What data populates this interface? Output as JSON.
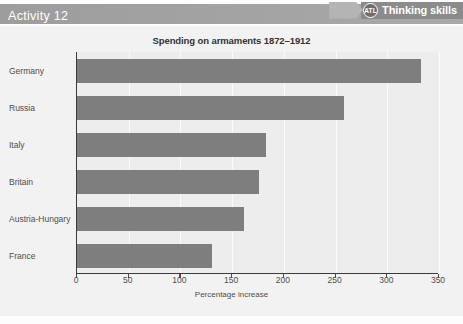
{
  "header": {
    "activity_title": "Activity 12",
    "badge": {
      "circle_text": "ATL",
      "label": "Thinking skills"
    }
  },
  "chart_data": {
    "type": "bar",
    "orientation": "horizontal",
    "title": "Spending on armaments 1872–1912",
    "xlabel": "Percentage increase",
    "ylabel": "",
    "categories": [
      "Germany",
      "Russia",
      "Italy",
      "Britain",
      "Austria-Hungary",
      "France"
    ],
    "values": [
      333,
      258,
      183,
      176,
      161,
      131
    ],
    "xlim": [
      0,
      350
    ],
    "xticks": [
      0,
      50,
      100,
      150,
      200,
      250,
      300,
      350
    ],
    "xtick_labels": [
      "0",
      "50",
      "100",
      "150",
      "200",
      "250",
      "300",
      "350"
    ],
    "grid": true,
    "legend": null,
    "bar_color": "#7e7e7e",
    "plot_background": "#ededed",
    "series": [
      {
        "name": "Percentage increase",
        "values": [
          333,
          258,
          183,
          176,
          161,
          131
        ]
      }
    ]
  },
  "colors": {
    "header_band": "#a2a2a2",
    "badge_body": "#8b8b8b",
    "bar": "#7e7e7e",
    "axis": "#3a3a3a",
    "card_background": "#f2f2f2"
  }
}
